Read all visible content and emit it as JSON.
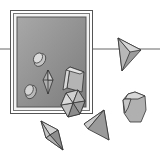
{
  "illustration": {
    "subject": "gray crystal and geometric solid shapes with framed display panel",
    "colors": {
      "background": "#ffffff",
      "line": "#555555",
      "panel": "#8a8a8a",
      "panel_light": "#b5b5b5",
      "frame": "#ffffff",
      "shape_light": "#c8c8c8",
      "shape_mid": "#a0a0a0",
      "shape_dark": "#767676"
    },
    "elements": [
      "horizontal-line",
      "framed-panel",
      "cylinder-upper",
      "cylinder-lower",
      "bipyramid-crystal-in-panel",
      "prism-block",
      "hexagonal-prism",
      "tetrahedron-right",
      "bipyramid-crystal-lower",
      "tetrahedron-lower",
      "octagonal-prism"
    ]
  }
}
